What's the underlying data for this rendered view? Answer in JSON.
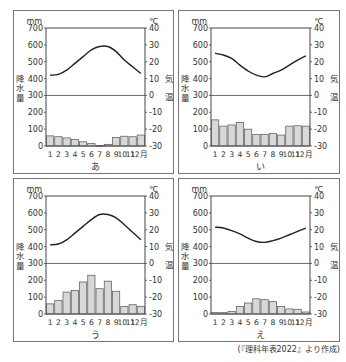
{
  "figure": {
    "caption": "(『理科年表2022』より作成)",
    "left_axis_unit": "mm",
    "right_axis_unit": "℃",
    "left_axis_label": "降水量",
    "right_axis_label": "気温",
    "left_ticks": [
      "700",
      "600",
      "500",
      "400",
      "300",
      "200",
      "100",
      "0"
    ],
    "right_ticks": [
      "40",
      "30",
      "20",
      "10",
      "0",
      "-10",
      "-20",
      "-30"
    ],
    "month_labels": [
      "1",
      "2",
      "3",
      "4",
      "5",
      "6",
      "7",
      "8",
      "9",
      "10",
      "11",
      "12月"
    ],
    "colors": {
      "bar_fill": "#d8d8d8",
      "bar_stroke": "#555555",
      "line": "#222222",
      "frame": "#444444"
    }
  },
  "chart_data": [
    {
      "type": "bar+line",
      "title": "あ",
      "categories": [
        "1",
        "2",
        "3",
        "4",
        "5",
        "6",
        "7",
        "8",
        "9",
        "10",
        "11",
        "12"
      ],
      "series": [
        {
          "name": "降水量 (mm)",
          "type": "bar",
          "axis": "left",
          "values": [
            60,
            55,
            48,
            38,
            25,
            15,
            3,
            10,
            50,
            58,
            55,
            65
          ]
        },
        {
          "name": "気温 (℃)",
          "type": "line",
          "axis": "right",
          "values": [
            12,
            12.5,
            15,
            19,
            23,
            27,
            29,
            29,
            26,
            21,
            17,
            13
          ]
        }
      ],
      "xlabel": "月",
      "ylabel_left": "降水量 (mm)",
      "ylabel_right": "気温 (℃)",
      "ylim_left": [
        0,
        700
      ],
      "ylim_right": [
        -30,
        40
      ],
      "grid": false,
      "reference_line": "300 mm / 0℃"
    },
    {
      "type": "bar+line",
      "title": "い",
      "categories": [
        "1",
        "2",
        "3",
        "4",
        "5",
        "6",
        "7",
        "8",
        "9",
        "10",
        "11",
        "12"
      ],
      "series": [
        {
          "name": "降水量 (mm)",
          "type": "bar",
          "axis": "left",
          "values": [
            155,
            118,
            125,
            140,
            100,
            68,
            68,
            75,
            65,
            118,
            120,
            118
          ]
        },
        {
          "name": "気温 (℃)",
          "type": "line",
          "axis": "right",
          "values": [
            25,
            24,
            22,
            18,
            14.5,
            12,
            11,
            13,
            15,
            18,
            21,
            23.5
          ]
        }
      ],
      "xlabel": "月",
      "ylabel_left": "降水量 (mm)",
      "ylabel_right": "気温 (℃)",
      "ylim_left": [
        0,
        700
      ],
      "ylim_right": [
        -30,
        40
      ],
      "grid": false,
      "reference_line": "300 mm / 0℃"
    },
    {
      "type": "bar+line",
      "title": "う",
      "categories": [
        "1",
        "2",
        "3",
        "4",
        "5",
        "6",
        "7",
        "8",
        "9",
        "10",
        "11",
        "12"
      ],
      "series": [
        {
          "name": "降水量 (mm)",
          "type": "bar",
          "axis": "left",
          "values": [
            60,
            80,
            130,
            140,
            190,
            230,
            150,
            195,
            135,
            45,
            55,
            45
          ]
        },
        {
          "name": "気温 (℃)",
          "type": "line",
          "axis": "right",
          "values": [
            11,
            11.5,
            14,
            18,
            22,
            26,
            29,
            29,
            27,
            23,
            18.5,
            14
          ]
        }
      ],
      "xlabel": "月",
      "ylabel_left": "降水量 (mm)",
      "ylabel_right": "気温 (℃)",
      "ylim_left": [
        0,
        700
      ],
      "ylim_right": [
        -30,
        40
      ],
      "grid": false,
      "reference_line": "300 mm / 0℃"
    },
    {
      "type": "bar+line",
      "title": "え",
      "categories": [
        "1",
        "2",
        "3",
        "4",
        "5",
        "6",
        "7",
        "8",
        "9",
        "10",
        "11",
        "12"
      ],
      "series": [
        {
          "name": "降水量 (mm)",
          "type": "bar",
          "axis": "left",
          "values": [
            8,
            8,
            15,
            45,
            65,
            90,
            85,
            75,
            45,
            30,
            28,
            12
          ]
        },
        {
          "name": "気温 (℃)",
          "type": "line",
          "axis": "right",
          "values": [
            21.5,
            21,
            19.5,
            17.5,
            15,
            13,
            12.5,
            13.5,
            15,
            17,
            19,
            21
          ]
        }
      ],
      "xlabel": "月",
      "ylabel_left": "降水量 (mm)",
      "ylabel_right": "気温 (℃)",
      "ylim_left": [
        0,
        700
      ],
      "ylim_right": [
        -30,
        40
      ],
      "grid": false,
      "reference_line": "300 mm / 0℃"
    }
  ]
}
